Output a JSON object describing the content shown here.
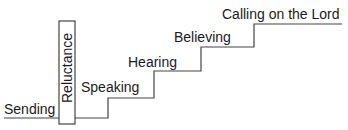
{
  "diagram": {
    "type": "staircase",
    "steps": [
      {
        "label": "Sending"
      },
      {
        "label": "Speaking"
      },
      {
        "label": "Hearing"
      },
      {
        "label": "Believing"
      },
      {
        "label": "Calling on the Lord"
      }
    ],
    "barrier": {
      "label": "Reluctance",
      "orientation": "vertical"
    },
    "colors": {
      "line": "#444444",
      "text": "#1a1a1a",
      "background": "#ffffff"
    }
  }
}
